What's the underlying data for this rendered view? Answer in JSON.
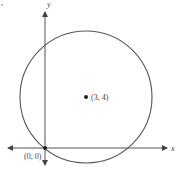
{
  "diagram": {
    "type": "coordinate-plane-circle",
    "axes": {
      "x_label": "x",
      "y_label": "y"
    },
    "circle": {
      "center_label": "(3, 4)",
      "passes_through_label": "(0, 0)"
    },
    "colors": {
      "stroke": "#555555",
      "dot": "#222222",
      "text": "#444444"
    }
  }
}
